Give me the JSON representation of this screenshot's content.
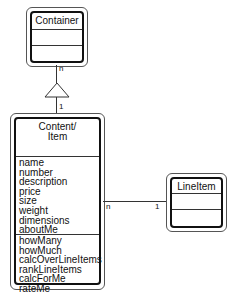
{
  "diagram": {
    "type": "uml-class-diagram",
    "classes": {
      "container": {
        "name": "Container",
        "attributes": [],
        "operations": []
      },
      "content_item": {
        "name_line1": "Content/",
        "name_line2": "Item",
        "attributes": [
          "name",
          "number",
          "description",
          "price",
          "size",
          "weight",
          "dimensions",
          "aboutMe"
        ],
        "operations": [
          "howMany",
          "howMuch",
          "calcOverLineItems",
          "rankLineItems",
          "calcForMe",
          "rateMe"
        ]
      },
      "line_item": {
        "name": "LineItem",
        "attributes": [],
        "operations": []
      }
    },
    "relationships": {
      "generalization": {
        "from": "Content/Item",
        "to": "Container",
        "multiplicity_container_end": "n",
        "multiplicity_content_end": "1"
      },
      "association": {
        "from": "Content/Item",
        "to": "LineItem",
        "multiplicity_content_end": "n",
        "multiplicity_lineitem_end": "1"
      }
    }
  }
}
